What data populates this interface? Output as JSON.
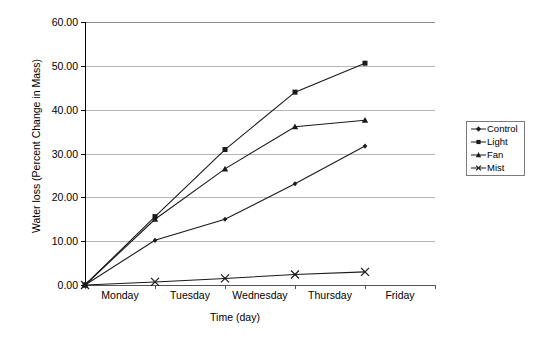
{
  "chart_data": {
    "type": "line",
    "title": "",
    "xlabel": "Time (day)",
    "ylabel": "Water loss (Percent Change in Mass)",
    "categories": [
      "Monday",
      "Tuesday",
      "Wednesday",
      "Thursday",
      "Friday"
    ],
    "ylim": [
      0,
      60
    ],
    "yticks": [
      "0.00",
      "10.00",
      "20.00",
      "30.00",
      "40.00",
      "50.00",
      "60.00"
    ],
    "ytick_values": [
      0,
      10,
      20,
      30,
      40,
      50,
      60
    ],
    "grid": true,
    "legend_position": "right",
    "series": [
      {
        "name": "Control",
        "marker": "diamond",
        "values": [
          0.0,
          10.2,
          15.0,
          23.1,
          31.7
        ]
      },
      {
        "name": "Light",
        "marker": "square",
        "values": [
          0.0,
          15.6,
          30.9,
          44.0,
          50.6
        ]
      },
      {
        "name": "Fan",
        "marker": "triangle",
        "values": [
          0.0,
          15.0,
          26.5,
          36.1,
          37.6
        ]
      },
      {
        "name": "Mist",
        "marker": "cross",
        "values": [
          0.0,
          0.7,
          1.5,
          2.4,
          3.0
        ]
      }
    ]
  },
  "legend": {
    "items": [
      {
        "label": "Control",
        "icon": "diamond-marker-icon"
      },
      {
        "label": "Light",
        "icon": "square-marker-icon"
      },
      {
        "label": "Fan",
        "icon": "triangle-marker-icon"
      },
      {
        "label": "Mist",
        "icon": "cross-marker-icon"
      }
    ]
  },
  "colors": {
    "line": "#1a1a1a",
    "grid": "#b5b5b5",
    "axis": "#000000",
    "background": "#ffffff"
  }
}
